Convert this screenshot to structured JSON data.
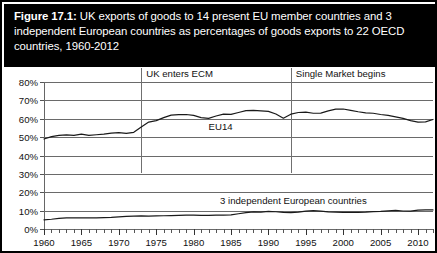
{
  "figure": {
    "label": "Figure 17.1:",
    "title_rest": " UK exports of goods to 14 present EU member countries and 3 independent European countries as percentages of goods exports to 22 OECD countries, 1960-2012"
  },
  "chart_data": {
    "type": "line",
    "title": "Figure 17.1: UK exports of goods to 14 present EU member countries and 3 independent European countries as percentages of goods exports to 22 OECD countries, 1960-2012",
    "xlabel": "",
    "ylabel": "",
    "xlim": [
      1960,
      2012
    ],
    "ylim": [
      0,
      80
    ],
    "grid": true,
    "legend_position": "inline-annotation",
    "ytick_labels": [
      "0%",
      "10%",
      "20%",
      "30%",
      "40%",
      "50%",
      "60%",
      "70%",
      "80%"
    ],
    "ytick_values": [
      0,
      10,
      20,
      30,
      40,
      50,
      60,
      70,
      80
    ],
    "xtick_labels": [
      "1960",
      "1965",
      "1970",
      "1975",
      "1980",
      "1985",
      "1990",
      "1995",
      "2000",
      "2005",
      "2010"
    ],
    "xtick_values": [
      1960,
      1965,
      1970,
      1975,
      1980,
      1985,
      1990,
      1995,
      2000,
      2005,
      2010
    ],
    "x": [
      1960,
      1961,
      1962,
      1963,
      1964,
      1965,
      1966,
      1967,
      1968,
      1969,
      1970,
      1971,
      1972,
      1973,
      1974,
      1975,
      1976,
      1977,
      1978,
      1979,
      1980,
      1981,
      1982,
      1983,
      1984,
      1985,
      1986,
      1987,
      1988,
      1989,
      1990,
      1991,
      1992,
      1993,
      1994,
      1995,
      1996,
      1997,
      1998,
      1999,
      2000,
      2001,
      2002,
      2003,
      2004,
      2005,
      2006,
      2007,
      2008,
      2009,
      2010,
      2011,
      2012
    ],
    "series": [
      {
        "name": "EU14",
        "values": [
          49.0,
          50.3,
          51.0,
          51.2,
          51.0,
          51.6,
          51.0,
          51.3,
          51.6,
          52.2,
          52.4,
          52.0,
          52.6,
          55.5,
          58.2,
          59.0,
          60.6,
          62.0,
          62.2,
          62.3,
          61.8,
          60.6,
          60.2,
          61.5,
          62.5,
          62.4,
          63.4,
          64.4,
          64.6,
          64.3,
          64.0,
          62.6,
          60.3,
          62.5,
          63.4,
          63.6,
          63.0,
          63.1,
          64.3,
          65.2,
          65.3,
          64.6,
          63.8,
          63.2,
          63.0,
          62.3,
          61.8,
          61.0,
          60.2,
          59.0,
          58.2,
          58.3,
          59.6
        ]
      },
      {
        "name": "3 independent European countries",
        "values": [
          5.0,
          5.3,
          5.8,
          6.0,
          6.1,
          6.0,
          6.1,
          6.1,
          6.2,
          6.3,
          6.6,
          6.9,
          7.0,
          7.1,
          7.0,
          7.1,
          7.2,
          7.3,
          7.4,
          7.5,
          7.5,
          7.4,
          7.4,
          7.5,
          7.6,
          7.7,
          8.3,
          8.9,
          9.3,
          9.2,
          9.6,
          9.4,
          9.0,
          8.9,
          9.2,
          9.7,
          10.0,
          9.7,
          9.3,
          9.2,
          9.0,
          9.0,
          9.1,
          9.2,
          9.5,
          9.6,
          9.9,
          10.1,
          9.8,
          9.7,
          10.3,
          10.4,
          10.4
        ]
      }
    ],
    "annotations": [
      {
        "text": "UK enters ECM",
        "x": 1973
      },
      {
        "text": "Single Market begins",
        "x": 1993
      }
    ]
  },
  "series_labels": {
    "eu14": "EU14",
    "independent": "3 independent European countries"
  },
  "annotations": {
    "ecm": "UK enters ECM",
    "single_market": "Single Market begins"
  }
}
